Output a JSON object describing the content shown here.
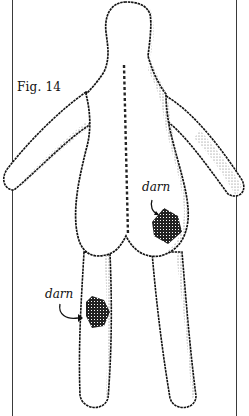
{
  "figure": {
    "label": "Fig. 14"
  },
  "annotations": [
    {
      "text": "darn",
      "target": "hip-patch"
    },
    {
      "text": "darn",
      "target": "leg-patch"
    }
  ],
  "colors": {
    "ink": "#111111",
    "stipple": "#555555",
    "background": "#ffffff",
    "frame": "#3a3a3a"
  }
}
